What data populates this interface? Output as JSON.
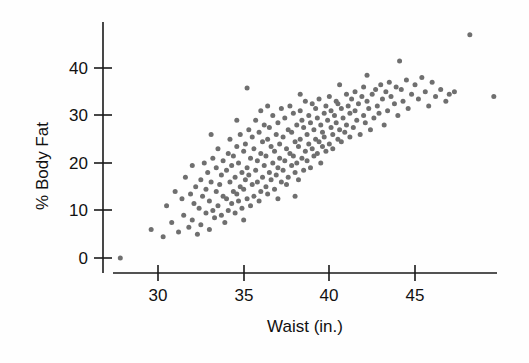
{
  "figure": {
    "background_color": "#fefefe",
    "point_color": "#6f6f6f",
    "axis_color": "#1a1a1a"
  },
  "chart_data": {
    "type": "scatter",
    "title": "",
    "subtitle": "",
    "xlabel": "Waist (in.)",
    "ylabel": "% Body Fat",
    "xlim": [
      27.0,
      50.5
    ],
    "ylim": [
      -1.5,
      49.5
    ],
    "xticks": [
      30,
      35,
      40,
      45
    ],
    "xticklabels": [
      "30",
      "35",
      "40",
      "45"
    ],
    "yticks": [
      0,
      10,
      20,
      30,
      40
    ],
    "yticklabels": [
      "0",
      "10",
      "20",
      "30",
      "40"
    ],
    "grid": false,
    "legend": null,
    "marker": "circle",
    "marker_size": 5,
    "n_points": 250,
    "x": [
      27.8,
      29.6,
      30.3,
      30.5,
      30.8,
      31.0,
      31.2,
      31.4,
      31.5,
      31.6,
      31.8,
      31.9,
      32.0,
      32.0,
      32.1,
      32.2,
      32.3,
      32.4,
      32.5,
      32.5,
      32.6,
      32.7,
      32.8,
      32.8,
      32.9,
      33.0,
      33.0,
      33.1,
      33.2,
      33.2,
      33.3,
      33.4,
      33.4,
      33.5,
      33.5,
      33.6,
      33.7,
      33.7,
      33.8,
      33.8,
      33.9,
      34.0,
      34.0,
      34.1,
      34.1,
      34.2,
      34.2,
      34.3,
      34.3,
      34.4,
      34.4,
      34.5,
      34.5,
      34.6,
      34.6,
      34.7,
      34.7,
      34.8,
      34.8,
      34.9,
      34.9,
      35.0,
      35.0,
      35.0,
      35.1,
      35.1,
      35.2,
      35.2,
      35.3,
      35.3,
      35.4,
      35.4,
      35.5,
      35.5,
      35.6,
      35.6,
      35.7,
      35.7,
      35.8,
      35.8,
      35.9,
      35.9,
      36.0,
      36.0,
      36.0,
      36.1,
      36.1,
      36.2,
      36.2,
      36.3,
      36.3,
      36.4,
      36.4,
      36.5,
      36.5,
      36.6,
      36.6,
      36.7,
      36.7,
      36.8,
      36.8,
      36.9,
      36.9,
      37.0,
      37.0,
      37.0,
      37.1,
      37.1,
      37.2,
      37.2,
      37.3,
      37.3,
      37.4,
      37.4,
      37.5,
      37.5,
      37.6,
      37.6,
      37.7,
      37.7,
      37.8,
      37.8,
      37.9,
      37.9,
      38.0,
      38.0,
      38.0,
      38.1,
      38.1,
      38.2,
      38.2,
      38.3,
      38.3,
      38.4,
      38.4,
      38.5,
      38.5,
      38.6,
      38.6,
      38.7,
      38.7,
      38.8,
      38.8,
      38.9,
      38.9,
      39.0,
      39.0,
      39.1,
      39.1,
      39.2,
      39.2,
      39.3,
      39.3,
      39.4,
      39.4,
      39.5,
      39.5,
      39.6,
      39.6,
      39.7,
      39.7,
      39.8,
      39.8,
      39.9,
      40.0,
      40.0,
      40.1,
      40.1,
      40.2,
      40.2,
      40.3,
      40.4,
      40.4,
      40.5,
      40.5,
      40.6,
      40.7,
      40.7,
      40.8,
      40.9,
      41.0,
      41.0,
      41.1,
      41.2,
      41.2,
      41.3,
      41.4,
      41.5,
      41.5,
      41.6,
      41.7,
      41.8,
      41.9,
      42.0,
      42.0,
      42.1,
      42.2,
      42.3,
      42.4,
      42.5,
      42.6,
      42.7,
      42.8,
      42.9,
      43.0,
      43.1,
      43.2,
      43.3,
      43.4,
      43.5,
      43.6,
      43.8,
      43.9,
      44.0,
      44.2,
      44.3,
      44.5,
      44.6,
      44.8,
      45.0,
      45.2,
      45.4,
      45.6,
      45.8,
      46.0,
      46.2,
      46.5,
      46.8,
      47.0,
      47.3,
      44.1,
      42.2,
      40.6,
      38.3,
      36.4,
      34.6,
      33.1,
      48.2,
      49.6,
      35.2
    ],
    "y": [
      0.0,
      6.0,
      4.5,
      11.0,
      7.5,
      14.0,
      5.5,
      12.5,
      9.0,
      17.0,
      6.5,
      13.5,
      8.0,
      19.5,
      11.5,
      15.0,
      5.0,
      10.5,
      16.5,
      7.0,
      13.0,
      20.0,
      9.5,
      14.5,
      18.0,
      6.0,
      12.0,
      16.0,
      10.0,
      21.0,
      8.5,
      14.0,
      19.0,
      11.0,
      23.0,
      15.5,
      9.0,
      17.5,
      13.0,
      20.5,
      7.5,
      12.5,
      18.5,
      10.0,
      22.0,
      16.0,
      25.0,
      11.5,
      19.5,
      14.0,
      21.5,
      9.5,
      17.0,
      13.5,
      23.5,
      12.0,
      20.0,
      15.0,
      26.0,
      10.5,
      18.0,
      14.5,
      22.5,
      8.0,
      16.5,
      24.0,
      12.5,
      19.0,
      17.5,
      27.0,
      11.0,
      21.0,
      15.5,
      25.5,
      13.0,
      23.0,
      18.5,
      29.0,
      16.0,
      20.5,
      12.0,
      26.5,
      14.0,
      22.0,
      31.0,
      17.0,
      24.5,
      19.5,
      28.0,
      15.0,
      21.5,
      13.5,
      25.0,
      18.0,
      27.5,
      16.5,
      23.5,
      20.0,
      30.0,
      14.5,
      22.5,
      17.5,
      26.0,
      12.5,
      19.0,
      28.5,
      21.0,
      24.0,
      16.0,
      31.5,
      18.5,
      25.5,
      20.5,
      29.5,
      15.5,
      23.0,
      17.0,
      27.0,
      22.0,
      32.0,
      19.5,
      26.5,
      21.5,
      30.5,
      18.0,
      24.5,
      13.0,
      28.0,
      20.0,
      23.5,
      16.5,
      31.0,
      25.0,
      21.0,
      29.0,
      18.5,
      27.5,
      22.5,
      33.0,
      20.5,
      26.0,
      24.0,
      30.0,
      19.0,
      28.5,
      23.0,
      32.5,
      21.5,
      27.0,
      25.0,
      31.5,
      22.0,
      29.5,
      24.5,
      33.5,
      20.0,
      28.0,
      26.5,
      23.5,
      30.5,
      25.5,
      32.0,
      22.5,
      29.0,
      24.0,
      34.0,
      27.5,
      31.0,
      26.0,
      23.0,
      30.0,
      28.5,
      33.0,
      25.0,
      32.5,
      27.0,
      24.5,
      31.5,
      29.5,
      26.5,
      34.5,
      28.0,
      32.0,
      30.5,
      25.5,
      33.5,
      27.5,
      31.0,
      35.0,
      29.0,
      32.5,
      26.0,
      34.0,
      30.0,
      36.0,
      28.5,
      33.0,
      31.5,
      27.0,
      34.5,
      29.5,
      35.5,
      32.0,
      30.5,
      36.5,
      33.5,
      28.0,
      35.0,
      31.0,
      37.0,
      34.0,
      32.5,
      36.0,
      30.0,
      35.5,
      33.0,
      37.5,
      31.5,
      34.5,
      36.5,
      33.5,
      38.0,
      35.0,
      32.0,
      37.0,
      34.0,
      35.5,
      33.0,
      34.5,
      35.0,
      41.5,
      38.5,
      36.5,
      34.5,
      32.0,
      29.0,
      26.0,
      47.0,
      34.0,
      35.8
    ]
  },
  "plot_geometry": {
    "x_axis_left_px": 113,
    "x_axis_right_px": 497,
    "x_axis_y_px": 273,
    "y_axis_x_px": 103,
    "y_axis_top_px": 22,
    "y_axis_bottom_px": 273,
    "x_tick_px": [
      158,
      244,
      329,
      415
    ],
    "y_tick_px": [
      258,
      210,
      163,
      115,
      68
    ]
  }
}
